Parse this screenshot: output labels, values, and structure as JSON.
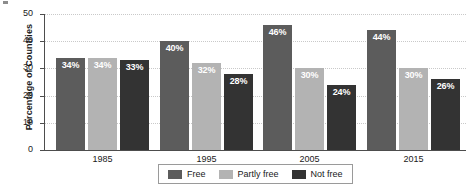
{
  "chart_data": {
    "type": "bar",
    "title": "",
    "subtitle": "",
    "xlabel": "",
    "ylabel": "Percentage of Countries",
    "categories": [
      "1985",
      "1995",
      "2005",
      "2015"
    ],
    "series": [
      {
        "name": "Free",
        "color": "#5c5c5c",
        "values": [
          34,
          40,
          46,
          44
        ],
        "labels": [
          "34%",
          "40%",
          "46%",
          "44%"
        ]
      },
      {
        "name": "Partly free",
        "color": "#b3b3b3",
        "values": [
          34,
          32,
          30,
          30
        ],
        "labels": [
          "34%",
          "32%",
          "30%",
          "30%"
        ]
      },
      {
        "name": "Not free",
        "color": "#333333",
        "values": [
          33,
          28,
          24,
          26
        ],
        "labels": [
          "33%",
          "28%",
          "24%",
          "26%"
        ]
      }
    ],
    "ylim": [
      0,
      50
    ],
    "yticks": [
      "0",
      "10",
      "20",
      "30",
      "40",
      "50"
    ],
    "ytick_values": [
      0,
      10,
      20,
      30,
      40,
      50
    ],
    "grid": true,
    "grid_axis": "y",
    "legend_position": "bottom-center",
    "value_labels": "inside-top-white-bold"
  },
  "legend": {
    "items": [
      {
        "label": "Free",
        "color": "#5c5c5c"
      },
      {
        "label": "Partly free",
        "color": "#b3b3b3"
      },
      {
        "label": "Not free",
        "color": "#333333"
      }
    ]
  },
  "colors": {
    "background": "#ffffff",
    "axis": "#4d4d4d",
    "gridline": "#c9c9c9",
    "text": "#1a1a1a",
    "label_text": "#ffffff",
    "legend_border": "#9a9a9a"
  }
}
